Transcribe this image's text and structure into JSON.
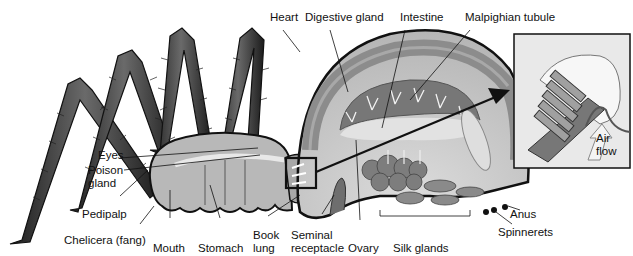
{
  "figure": {
    "labels": {
      "heart": "Heart",
      "digestive_gland": "Digestive gland",
      "intestine": "Intestine",
      "malpighian_tubule": "Malpighian tubule",
      "eyes": "Eyes",
      "poison_gland_1": "Poison",
      "poison_gland_2": "gland",
      "pedipalp": "Pedipalp",
      "chelicera": "Chelicera (fang)",
      "mouth": "Mouth",
      "stomach": "Stomach",
      "book_lung_1": "Book",
      "book_lung_2": "lung",
      "seminal_receptacle_1": "Seminal",
      "seminal_receptacle_2": "receptacle",
      "ovary": "Ovary",
      "silk_glands": "Silk glands",
      "anus": "Anus",
      "spinnerets": "Spinnerets"
    },
    "inset": {
      "title": "Book lung detail",
      "air_flow_1": "Air",
      "air_flow_2": "flow"
    },
    "colors": {
      "outline": "#111111",
      "body_light": "#c9c9c9",
      "body_mid": "#9a9a9a",
      "body_dark": "#6e6e6e",
      "leg_dark": "#2e2e2e"
    }
  }
}
